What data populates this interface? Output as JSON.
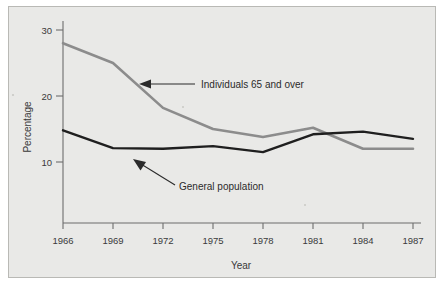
{
  "figure": {
    "background_color": "#e9e9e7",
    "border_color": "#b9b9b5"
  },
  "chart_data": {
    "type": "line",
    "title": "",
    "subtitle": "",
    "xlabel": "Year",
    "ylabel": "Percentage",
    "x": [
      1966,
      1969,
      1972,
      1975,
      1978,
      1981,
      1984,
      1987
    ],
    "categories": [
      "1966",
      "1969",
      "1972",
      "1975",
      "1978",
      "1981",
      "1984",
      "1987"
    ],
    "xtick_labels": [
      "1966",
      "1969",
      "1972",
      "1975",
      "1978",
      "1981",
      "1984",
      "1987"
    ],
    "ytick_labels": [
      "10",
      "20",
      "30"
    ],
    "ytick_values": [
      10,
      20,
      30
    ],
    "xlim": [
      1966,
      1987
    ],
    "ylim": [
      0,
      32
    ],
    "grid": false,
    "legend": "none",
    "series": [
      {
        "name": "Individuals 65 and over",
        "color": "#8c8c8c",
        "line_width": 2.6,
        "values": [
          28.0,
          25.0,
          18.2,
          15.0,
          13.8,
          15.2,
          12.0,
          12.0
        ]
      },
      {
        "name": "General population",
        "color": "#1f1f1f",
        "line_width": 2.4,
        "values": [
          14.8,
          12.1,
          12.0,
          12.4,
          11.5,
          14.2,
          14.6,
          13.5
        ]
      }
    ],
    "annotations": [
      {
        "text": "Individuals 65 and over",
        "target_series": "Individuals 65 and over",
        "arrow": "left-arrow"
      },
      {
        "text": "General population",
        "target_series": "General population",
        "arrow": "diagonal-up-left-arrow"
      }
    ]
  }
}
